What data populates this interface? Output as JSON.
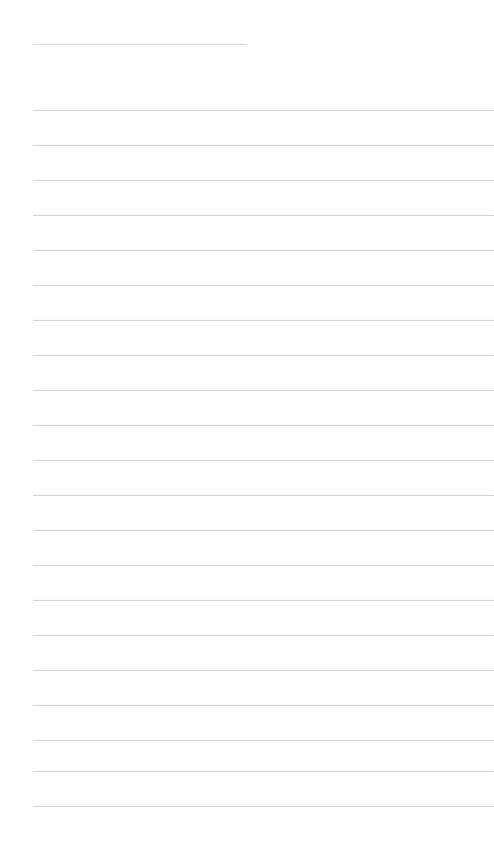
{
  "page": {
    "width": 494,
    "height": 845,
    "background_color": "#ffffff",
    "kind": "blank-lined-page",
    "rule_color": "#d7d7dc",
    "title_rule_color": "#dcdce0",
    "left_margin_x": 33,
    "right_edge_x": 494,
    "line_spacing_px": 35
  },
  "title_field": {
    "value": "",
    "placeholder": "",
    "rule": {
      "x": 33,
      "y": 44,
      "width": 213
    }
  },
  "body_lines": [
    {
      "index": 1,
      "value": "",
      "placeholder": "",
      "rule": {
        "x": 33,
        "y": 110,
        "width": 461
      }
    },
    {
      "index": 2,
      "value": "",
      "placeholder": "",
      "rule": {
        "x": 33,
        "y": 145,
        "width": 461
      }
    },
    {
      "index": 3,
      "value": "",
      "placeholder": "",
      "rule": {
        "x": 33,
        "y": 180,
        "width": 461
      }
    },
    {
      "index": 4,
      "value": "",
      "placeholder": "",
      "rule": {
        "x": 33,
        "y": 215,
        "width": 461
      }
    },
    {
      "index": 5,
      "value": "",
      "placeholder": "",
      "rule": {
        "x": 33,
        "y": 250,
        "width": 461
      }
    },
    {
      "index": 6,
      "value": "",
      "placeholder": "",
      "rule": {
        "x": 33,
        "y": 285,
        "width": 461
      }
    },
    {
      "index": 7,
      "value": "",
      "placeholder": "",
      "rule": {
        "x": 33,
        "y": 320,
        "width": 461
      }
    },
    {
      "index": 8,
      "value": "",
      "placeholder": "",
      "rule": {
        "x": 33,
        "y": 355,
        "width": 461
      }
    },
    {
      "index": 9,
      "value": "",
      "placeholder": "",
      "rule": {
        "x": 33,
        "y": 390,
        "width": 461
      }
    },
    {
      "index": 10,
      "value": "",
      "placeholder": "",
      "rule": {
        "x": 33,
        "y": 425,
        "width": 461
      }
    },
    {
      "index": 11,
      "value": "",
      "placeholder": "",
      "rule": {
        "x": 33,
        "y": 460,
        "width": 461
      }
    },
    {
      "index": 12,
      "value": "",
      "placeholder": "",
      "rule": {
        "x": 33,
        "y": 495,
        "width": 461
      }
    },
    {
      "index": 13,
      "value": "",
      "placeholder": "",
      "rule": {
        "x": 33,
        "y": 530,
        "width": 461
      }
    },
    {
      "index": 14,
      "value": "",
      "placeholder": "",
      "rule": {
        "x": 33,
        "y": 565,
        "width": 461
      }
    },
    {
      "index": 15,
      "value": "",
      "placeholder": "",
      "rule": {
        "x": 33,
        "y": 600,
        "width": 461
      }
    },
    {
      "index": 16,
      "value": "",
      "placeholder": "",
      "rule": {
        "x": 33,
        "y": 635,
        "width": 461
      }
    },
    {
      "index": 17,
      "value": "",
      "placeholder": "",
      "rule": {
        "x": 33,
        "y": 670,
        "width": 461
      }
    },
    {
      "index": 18,
      "value": "",
      "placeholder": "",
      "rule": {
        "x": 33,
        "y": 705,
        "width": 461
      }
    },
    {
      "index": 19,
      "value": "",
      "placeholder": "",
      "rule": {
        "x": 33,
        "y": 740,
        "width": 461
      }
    },
    {
      "index": 20,
      "value": "",
      "placeholder": "",
      "rule": {
        "x": 33,
        "y": 771,
        "width": 461
      }
    },
    {
      "index": 21,
      "value": "",
      "placeholder": "",
      "rule": {
        "x": 33,
        "y": 806,
        "width": 461
      }
    }
  ]
}
